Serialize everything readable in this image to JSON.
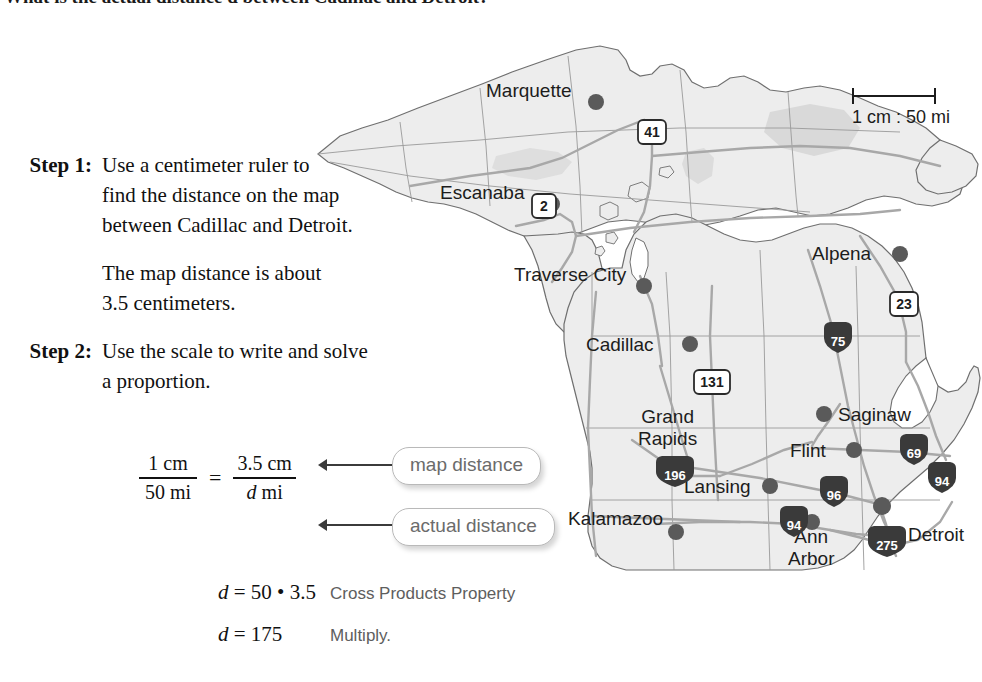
{
  "heading": {
    "text": "What is the actual distance d between Cadillac and Detroit?"
  },
  "steps": [
    {
      "label": "Step 1:",
      "lines": [
        "Use a centimeter ruler to",
        "find the distance on the map",
        "between Cadillac and Detroit."
      ],
      "followup": [
        "The map distance is about",
        "3.5 centimeters."
      ]
    },
    {
      "label": "Step 2:",
      "lines": [
        "Use the scale to write and solve",
        "a proportion."
      ],
      "followup": []
    }
  ],
  "proportion": {
    "left": {
      "numerator": "1 cm",
      "denominator": "50 mi"
    },
    "equals": "=",
    "right": {
      "numerator": "3.5 cm",
      "denominator_italic": "d",
      "denominator_rest": " mi"
    },
    "callout_map": "map distance",
    "callout_actual": "actual distance"
  },
  "derivation": [
    {
      "equation_var": "d",
      "equation_rest": " = 50 • 3.5",
      "note": "Cross Products Property"
    },
    {
      "equation_var": "d",
      "equation_rest": " = 175",
      "note": "Multiply."
    }
  ],
  "map": {
    "scale_bar": {
      "label": "1 cm : 50 mi"
    },
    "cities": [
      {
        "name": "Marquette",
        "x": 263,
        "y": 52,
        "align": "right"
      },
      {
        "name": "Escanaba",
        "x": 206,
        "y": 152,
        "align": "right"
      },
      {
        "name": "Traverse City",
        "x": 330,
        "y": 237,
        "align": "right"
      },
      {
        "name": "Alpena",
        "x": 575,
        "y": 210,
        "align": "right"
      },
      {
        "name": "Cadillac",
        "x": 348,
        "y": 303,
        "align": "right"
      },
      {
        "name": "Grand Rapids",
        "x": 395,
        "y": 372,
        "align": "center",
        "lines": [
          "Grand",
          "Rapids"
        ]
      },
      {
        "name": "Saginaw",
        "x": 540,
        "y": 370,
        "align": "left"
      },
      {
        "name": "Flint",
        "x": 512,
        "y": 405,
        "align": "right"
      },
      {
        "name": "Lansing",
        "x": 420,
        "y": 440,
        "align": "right"
      },
      {
        "name": "Kalamazoo",
        "x": 355,
        "y": 473,
        "align": "right"
      },
      {
        "name": "Ann Arbor",
        "x": 520,
        "y": 495,
        "align": "center",
        "lines": [
          "Ann",
          "Arbor"
        ]
      },
      {
        "name": "Detroit",
        "x": 620,
        "y": 495,
        "align": "left"
      }
    ],
    "route_shields": [
      {
        "number": "41",
        "type": "us",
        "x": 350,
        "y": 96
      },
      {
        "number": "2",
        "type": "us",
        "x": 244,
        "y": 170
      },
      {
        "number": "23",
        "type": "us",
        "x": 602,
        "y": 268
      },
      {
        "number": "131",
        "type": "us",
        "x": 413,
        "y": 345
      },
      {
        "number": "75",
        "type": "interstate",
        "x": 537,
        "y": 303
      },
      {
        "number": "196",
        "type": "interstate",
        "x": 375,
        "y": 438
      },
      {
        "number": "96",
        "type": "interstate",
        "x": 533,
        "y": 456
      },
      {
        "number": "69",
        "type": "interstate",
        "x": 613,
        "y": 415
      },
      {
        "number": "94",
        "type": "interstate",
        "x": 640,
        "y": 443
      },
      {
        "number": "94",
        "type": "interstate",
        "x": 492,
        "y": 487
      },
      {
        "number": "275",
        "type": "interstate",
        "x": 588,
        "y": 507
      }
    ],
    "colors": {
      "land_fill": "#ededed",
      "land_stroke": "#6f6f6f",
      "road": "#a8a8a8",
      "city_dot": "#5a5a5a",
      "interstate_shield": "#3a3a3a",
      "label_text": "#1c1c1c"
    }
  }
}
